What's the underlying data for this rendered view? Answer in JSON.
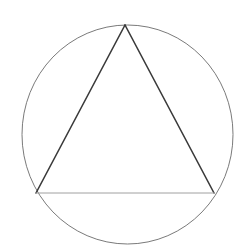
{
  "diagram": {
    "circle": {
      "cx": 127.5,
      "cy": 134.5,
      "rx": 105.5,
      "ry": 109.5,
      "stroke": "#7a7a7a",
      "stroke_width": 1
    },
    "triangle": {
      "vertices": [
        {
          "name": "top",
          "x": 125,
          "y": 25
        },
        {
          "name": "bottom-left",
          "x": 36,
          "y": 193
        },
        {
          "name": "bottom-right",
          "x": 214,
          "y": 193
        }
      ],
      "sides": [
        {
          "name": "left-side",
          "from": "top",
          "to": "bottom-left",
          "stroke": "#3a3a3a",
          "stroke_width": 1.6
        },
        {
          "name": "right-side",
          "from": "top",
          "to": "bottom-right",
          "stroke": "#3a3a3a",
          "stroke_width": 1.6
        },
        {
          "name": "base",
          "from": "bottom-left",
          "to": "bottom-right",
          "stroke": "#a0a0a0",
          "stroke_width": 1
        }
      ]
    },
    "background": "#ffffff"
  }
}
